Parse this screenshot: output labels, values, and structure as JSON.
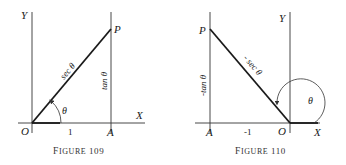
{
  "figures": [
    {
      "caption": "Figure 109",
      "caption_small": "IGURE",
      "caption_first": "F",
      "caption_num": "109",
      "labels": {
        "y_axis": "Y",
        "x_axis": "X",
        "origin": "O",
        "point_a": "A",
        "point_p": "P",
        "hypotenuse": "sec θ",
        "opposite": "tan θ",
        "adjacent": "1",
        "angle": "θ"
      }
    },
    {
      "caption": "Figure 110",
      "caption_small": "IGURE",
      "caption_first": "F",
      "caption_num": "110",
      "labels": {
        "y_axis": "Y",
        "x_axis": "X",
        "origin": "O",
        "point_a": "A",
        "point_p": "P",
        "hypotenuse": "- sec θ",
        "opposite": "-tan θ",
        "adjacent": "-1",
        "angle": "θ"
      }
    }
  ]
}
